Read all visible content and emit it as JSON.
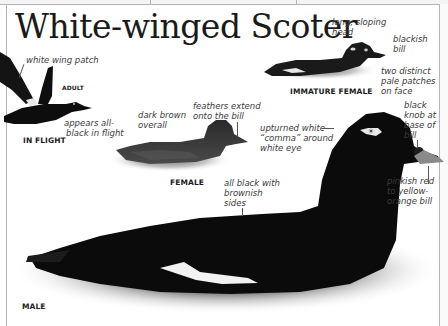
{
  "page": {
    "title": "White-winged Scoter"
  },
  "figures": {
    "in_flight": {
      "caption": "IN FLIGHT",
      "sub_caption": "ADULT",
      "notes": {
        "wing_patch": "white wing patch",
        "appears_black_1": "appears all-",
        "appears_black_2": "black in flight"
      }
    },
    "immature_female": {
      "caption": "IMMATURE FEMALE",
      "notes": {
        "head_1": "long, sloping",
        "head_2": "head",
        "bill_1": "blackish",
        "bill_2": "bill",
        "face_1": "two distinct",
        "face_2": "pale patches",
        "face_3": "on face"
      }
    },
    "female": {
      "caption": "FEMALE",
      "notes": {
        "overall_1": "dark brown",
        "overall_2": "overall",
        "feathers_1": "feathers extend",
        "feathers_2": "onto the bill"
      }
    },
    "male": {
      "caption": "MALE",
      "notes": {
        "eye_1": "upturned white",
        "eye_2": "“comma” around",
        "eye_3": "white eye",
        "knob_1": "black",
        "knob_2": "knob at",
        "knob_3": "base of",
        "knob_4": "bill",
        "bill_1": "pinkish red",
        "bill_2": "to yellow-",
        "bill_3": "orange bill",
        "sides_1": "all black with",
        "sides_2": "brownish",
        "sides_3": "sides"
      }
    }
  },
  "colors": {
    "plumage": "#0e0e0e",
    "water_shadow": "#6a6a6a",
    "frame": "#b5b5b5",
    "text": "#3a3a3a"
  }
}
